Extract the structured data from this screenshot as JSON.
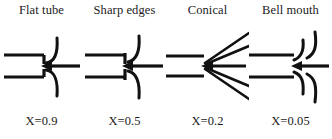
{
  "diagram": {
    "type": "pipe-entrance-loss-coefficients",
    "columns": [
      {
        "title": "Flat tube",
        "x_label": "X=0.9",
        "x_value": 0.9,
        "entrance_shape": "flat-tube",
        "flow_direction": "right-to-left"
      },
      {
        "title": "Sharp edges",
        "x_label": "X=0.5",
        "x_value": 0.5,
        "entrance_shape": "sharp-edged",
        "flow_direction": "right-to-left"
      },
      {
        "title": "Conical",
        "x_label": "X=0.2",
        "x_value": 0.2,
        "entrance_shape": "conical",
        "flow_direction": "right-to-left"
      },
      {
        "title": "Bell mouth",
        "x_label": "X=0.05",
        "x_value": 0.05,
        "entrance_shape": "bell-mouth",
        "flow_direction": "right-to-left"
      }
    ],
    "colors": {
      "background": "#ffffff",
      "ink": "#111111",
      "text": "#1a1a1a"
    }
  }
}
